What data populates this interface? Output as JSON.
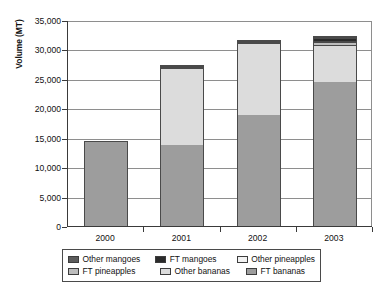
{
  "chart_data": {
    "type": "bar",
    "stacked": true,
    "title": "",
    "xlabel": "",
    "ylabel": "Volume (MT)",
    "categories": [
      "2000",
      "2001",
      "2002",
      "2003"
    ],
    "ylim": [
      0,
      35000
    ],
    "yticks": [
      "0",
      "5,000",
      "10,000",
      "15,000",
      "20,000",
      "25,000",
      "30,000",
      "35,000"
    ],
    "ytick_values": [
      0,
      5000,
      10000,
      15000,
      20000,
      25000,
      30000,
      35000
    ],
    "grid": "horizontal",
    "legend_position": "bottom",
    "series": [
      {
        "name": "FT bananas",
        "color": "#9d9d9d",
        "values": [
          14500,
          13900,
          19000,
          24600
        ]
      },
      {
        "name": "Other bananas",
        "color": "#dcdcdc",
        "values": [
          0,
          13300,
          12300,
          6300
        ]
      },
      {
        "name": "FT pineapples",
        "color": "#bdbdbd",
        "values": [
          0,
          0,
          0,
          450
        ]
      },
      {
        "name": "Other pineapples",
        "color": "#f2f2f2",
        "values": [
          0,
          0,
          0,
          300
        ]
      },
      {
        "name": "FT mangoes",
        "color": "#2b2b2b",
        "values": [
          0,
          150,
          250,
          450
        ]
      },
      {
        "name": "Other mangoes",
        "color": "#5c5c5c",
        "values": [
          0,
          80,
          120,
          180
        ]
      }
    ],
    "totals": [
      14500,
      27430,
      31670,
      32280
    ],
    "legend_order": [
      "Other mangoes",
      "FT mangoes",
      "Other pineapples",
      "FT pineapples",
      "Other bananas",
      "FT bananas"
    ]
  },
  "legend": {
    "rows": [
      [
        {
          "label": "Other mangoes",
          "color": "#5c5c5c"
        },
        {
          "label": "FT mangoes",
          "color": "#2b2b2b"
        },
        {
          "label": "Other pineapples",
          "color": "#f2f2f2"
        }
      ],
      [
        {
          "label": "FT pineapples",
          "color": "#bdbdbd"
        },
        {
          "label": "Other bananas",
          "color": "#dcdcdc"
        },
        {
          "label": "FT bananas",
          "color": "#9d9d9d"
        }
      ]
    ]
  }
}
